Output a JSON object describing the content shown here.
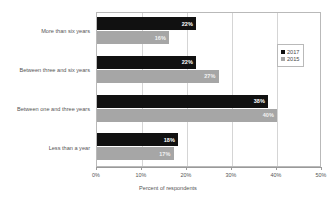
{
  "chart_data": {
    "type": "bar",
    "orientation": "horizontal",
    "title": "",
    "xlabel": "Percent of respondents",
    "ylabel": "",
    "xlim": [
      0,
      50
    ],
    "xtick_labels": [
      "0%",
      "10%",
      "20%",
      "30%",
      "40%",
      "50%"
    ],
    "xtick_values": [
      0,
      10,
      20,
      30,
      40,
      50
    ],
    "grid": true,
    "legend_position": "right",
    "categories": [
      "More than six years",
      "Between three and six years",
      "Between one and three years",
      "Less than a year"
    ],
    "series": [
      {
        "name": "2017",
        "color": "#111111",
        "values": [
          22,
          22,
          38,
          18
        ],
        "labels": [
          "22%",
          "22%",
          "38%",
          "18%"
        ]
      },
      {
        "name": "2015",
        "color": "#a6a6a6",
        "values": [
          16,
          27,
          40,
          17
        ],
        "labels": [
          "16%",
          "27%",
          "40%",
          "17%"
        ]
      }
    ]
  },
  "legend": {
    "items": [
      {
        "label": "2017",
        "marker": "square-black-icon"
      },
      {
        "label": "2015",
        "marker": "square-gray-icon"
      }
    ]
  }
}
